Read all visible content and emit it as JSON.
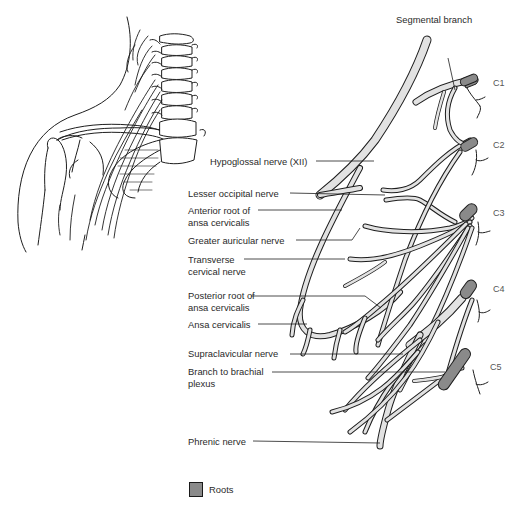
{
  "figure": {
    "colors": {
      "nerve_fill": "#e2e2e2",
      "nerve_stroke": "#1e1e1e",
      "root_fill": "#8a8a8a",
      "leader_line": "#1e1e1e",
      "background": "#ffffff"
    }
  },
  "labels": {
    "segmental_branch": "Segmental branch",
    "hypoglossal": "Hypoglossal nerve (XII)",
    "lesser_occipital": "Lesser occipital nerve",
    "anterior_root": "Anterior root of ansa cervicalis",
    "greater_auricular": "Greater auricular nerve",
    "transverse_cervical": "Transverse cervical nerve",
    "posterior_root": "Posterior root of ansa cervicalis",
    "ansa_cervicalis": "Ansa cervicalis",
    "supraclavicular": "Supraclavicular nerve",
    "branch_brachial": "Branch to brachial plexus",
    "phrenic": "Phrenic nerve"
  },
  "roots": [
    "C1",
    "C2",
    "C3",
    "C4",
    "C5"
  ],
  "legend": {
    "items": [
      {
        "label": "Roots",
        "color": "#8a8a8a"
      }
    ]
  },
  "inset": {
    "description": "Neck and shoulder outline with cervical vertebrae and plexus location"
  }
}
